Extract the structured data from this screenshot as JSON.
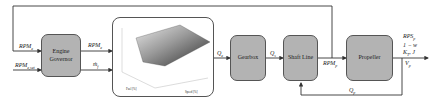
{
  "blocks": {
    "engine_governor": "Engine Governor",
    "gearbox": "Gearbox",
    "shaft_line": "Shaft Line",
    "propeller": "Propeller"
  },
  "engine_map": {
    "type": "3d-surface",
    "xlabel": "Speed [%]",
    "ylabel": "Fuel [%]",
    "zlabel": "Torque [%]"
  },
  "signals": {
    "rpm_e_feedback": "RPM_e",
    "rpm_e_set": "RPM_e,set",
    "rpm_e_out": "RPM_e",
    "m_f": "ṁ_f",
    "q_e": "Q_e",
    "q_s": "Q_s",
    "rpm_p": "RPM_p",
    "q_p": "Q_p",
    "outputs": [
      "RPS_p",
      "1 − w",
      "K_T, J",
      "V_p"
    ]
  },
  "colors": {
    "block_fill": "#b3b3b3",
    "line": "#333333"
  }
}
